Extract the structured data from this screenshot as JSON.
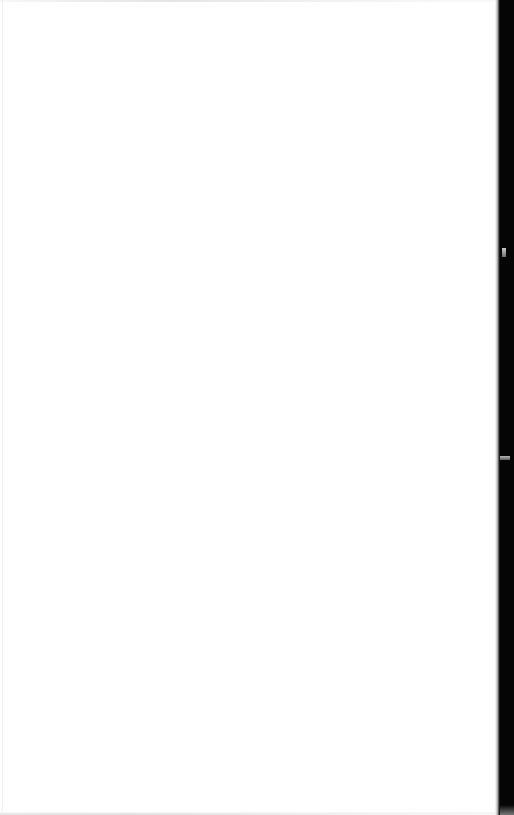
{
  "page": {
    "title": "",
    "body_text": "",
    "state_label": "",
    "background_color": "#ffffff",
    "width": 514,
    "height": 815
  },
  "content": {
    "heading": "",
    "paragraph": "",
    "placeholder": ""
  },
  "edges": {
    "top_hairline_color": "#e4e4e6",
    "left_hairline_color": "#f0f0f1",
    "bottom_hairline_color": "#e2e2e3"
  },
  "right_panel": {
    "label": "",
    "color": "#050505",
    "tick_color": "#9a9a9a",
    "ticks": [
      {
        "name": "upper",
        "y": 248
      },
      {
        "name": "lower",
        "y": 456
      }
    ]
  }
}
